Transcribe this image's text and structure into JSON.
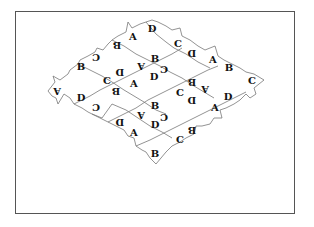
{
  "figure": {
    "colors": {
      "border": "#555555",
      "edges": "#777777",
      "text": "#111111",
      "background": "#ffffff"
    }
  },
  "labels": [
    {
      "t": "D",
      "x": 152,
      "y": 29,
      "rot": false
    },
    {
      "t": "A",
      "x": 133,
      "y": 37,
      "rot": false
    },
    {
      "t": "B",
      "x": 117,
      "y": 45,
      "rot": true
    },
    {
      "t": "C",
      "x": 96,
      "y": 57,
      "rot": true
    },
    {
      "t": "B",
      "x": 81,
      "y": 67,
      "rot": false
    },
    {
      "t": "A",
      "x": 57,
      "y": 91,
      "rot": true
    },
    {
      "t": "C",
      "x": 178,
      "y": 44,
      "rot": false
    },
    {
      "t": "D",
      "x": 192,
      "y": 53,
      "rot": true
    },
    {
      "t": "A",
      "x": 213,
      "y": 60,
      "rot": false
    },
    {
      "t": "B",
      "x": 229,
      "y": 68,
      "rot": false
    },
    {
      "t": "C",
      "x": 252,
      "y": 81,
      "rot": false
    },
    {
      "t": "B",
      "x": 155,
      "y": 59,
      "rot": false
    },
    {
      "t": "A",
      "x": 141,
      "y": 66,
      "rot": true
    },
    {
      "t": "C",
      "x": 164,
      "y": 69,
      "rot": true
    },
    {
      "t": "D",
      "x": 154,
      "y": 77,
      "rot": false
    },
    {
      "t": "D",
      "x": 120,
      "y": 72,
      "rot": true
    },
    {
      "t": "C",
      "x": 107,
      "y": 81,
      "rot": false
    },
    {
      "t": "A",
      "x": 134,
      "y": 84,
      "rot": false
    },
    {
      "t": "B",
      "x": 116,
      "y": 91,
      "rot": true
    },
    {
      "t": "D",
      "x": 81,
      "y": 98,
      "rot": false
    },
    {
      "t": "C",
      "x": 96,
      "y": 107,
      "rot": true
    },
    {
      "t": "B",
      "x": 192,
      "y": 82,
      "rot": true
    },
    {
      "t": "A",
      "x": 205,
      "y": 89,
      "rot": true
    },
    {
      "t": "C",
      "x": 180,
      "y": 93,
      "rot": false
    },
    {
      "t": "D",
      "x": 192,
      "y": 100,
      "rot": true
    },
    {
      "t": "D",
      "x": 228,
      "y": 97,
      "rot": false
    },
    {
      "t": "A",
      "x": 215,
      "y": 108,
      "rot": false
    },
    {
      "t": "B",
      "x": 155,
      "y": 106,
      "rot": false
    },
    {
      "t": "A",
      "x": 141,
      "y": 115,
      "rot": true
    },
    {
      "t": "C",
      "x": 164,
      "y": 117,
      "rot": true
    },
    {
      "t": "D",
      "x": 155,
      "y": 125,
      "rot": false
    },
    {
      "t": "D",
      "x": 120,
      "y": 122,
      "rot": true
    },
    {
      "t": "A",
      "x": 134,
      "y": 133,
      "rot": false
    },
    {
      "t": "B",
      "x": 192,
      "y": 130,
      "rot": true
    },
    {
      "t": "C",
      "x": 180,
      "y": 140,
      "rot": false
    },
    {
      "t": "B",
      "x": 155,
      "y": 154,
      "rot": false
    }
  ]
}
